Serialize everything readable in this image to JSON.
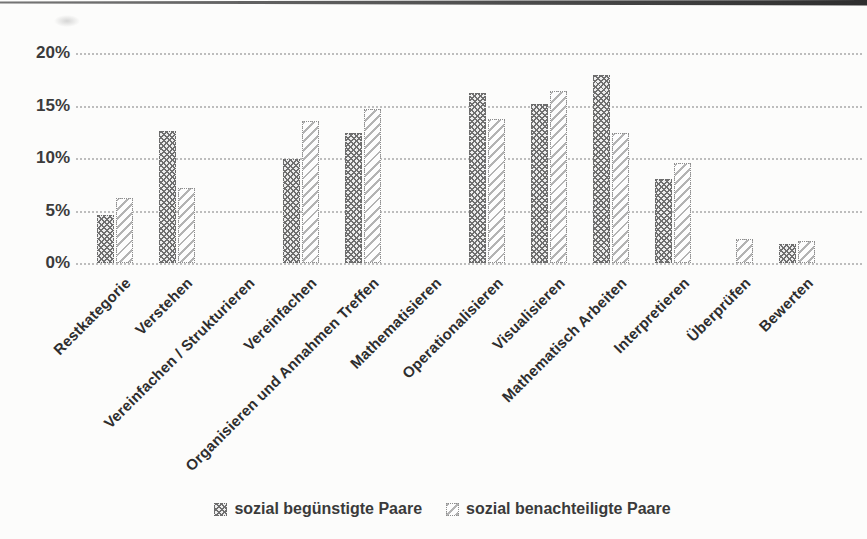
{
  "chart_data": {
    "type": "bar",
    "title": "",
    "xlabel": "",
    "ylabel": "",
    "categories": [
      "Restkategorie",
      "Verstehen",
      "Vereinfachen / Strukturieren",
      "Vereinfachen",
      "Organisieren und Annahmen Treffen",
      "Mathematisieren",
      "Operationalisieren",
      "Visualisieren",
      "Mathematisch Arbeiten",
      "Interpretieren",
      "Überprüfen",
      "Bewerten"
    ],
    "series": [
      {
        "name": "sozial begünstigte Paare",
        "pattern": "dark-crosshatch",
        "color": "#8c8c8c",
        "values": [
          4.6,
          12.6,
          0,
          9.9,
          12.4,
          0,
          16.2,
          15.1,
          17.9,
          8.0,
          0,
          1.8
        ]
      },
      {
        "name": "sozial benachteiligte Paare",
        "pattern": "light-diagonal-hatch",
        "color": "#c9c9c9",
        "values": [
          6.2,
          7.1,
          0,
          13.5,
          14.7,
          0,
          13.7,
          16.4,
          12.4,
          9.5,
          2.3,
          2.1
        ]
      }
    ],
    "y_ticks": [
      "0%",
      "5%",
      "10%",
      "15%",
      "20%"
    ],
    "y_tick_values": [
      0,
      5,
      10,
      15,
      20
    ],
    "ylim": [
      0,
      20
    ],
    "grid": "horizontal-dotted",
    "gridline_color": "#bdbdbd",
    "legend_position": "bottom-center"
  }
}
